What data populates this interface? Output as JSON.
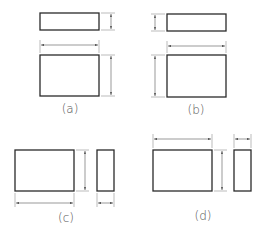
{
  "figure": {
    "colors": {
      "object_line": "#2a2a2a",
      "dimension_line": "#555555",
      "label": "#555555",
      "background": "#ffffff"
    },
    "panels": [
      {
        "id": "a",
        "label": "(a)",
        "layout": "top view above front view; height dims on right; width dim between views"
      },
      {
        "id": "b",
        "label": "(b)",
        "layout": "top view above front view; height dims on left; width dim between views"
      },
      {
        "id": "c",
        "label": "(c)",
        "layout": "front view beside side view; height dim between views; width dims below"
      },
      {
        "id": "d",
        "label": "(d)",
        "layout": "front view beside side view; height dim between views; width dims above"
      }
    ]
  }
}
